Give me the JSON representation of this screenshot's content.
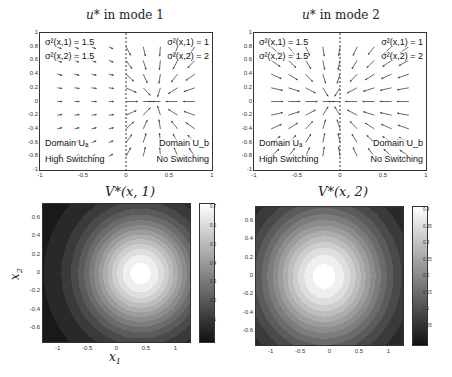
{
  "chart_data": [
    {
      "type": "quiver",
      "title": "u* in mode 1",
      "xlim": [
        -1,
        1
      ],
      "ylim": [
        -1,
        1
      ],
      "xticks": [
        "-1",
        "-0.5",
        "0",
        "0.5",
        "1"
      ],
      "yticks": [
        "1",
        "0.8",
        "0.6",
        "0.4",
        "0.2",
        "0",
        "-0.2",
        "-0.4",
        "-0.6",
        "-0.8",
        "-1"
      ],
      "divider_x": 0,
      "annotations": {
        "left_sigma1": "σ²(x,1) = 1.5",
        "left_sigma2": "σ²(x,2) = 1.5",
        "right_sigma1": "σ²(x,1) = 1",
        "right_sigma2": "σ²(x,2) = 2",
        "left_domain": "Domain Uₐ",
        "left_desc": "High Switching",
        "right_domain": "Domain U_b",
        "right_desc": "No Switching"
      },
      "attractor": [
        0.35,
        0
      ]
    },
    {
      "type": "quiver",
      "title": "u* in mode 2",
      "xlim": [
        -1,
        1
      ],
      "ylim": [
        -1,
        1
      ],
      "xticks": [
        "-1",
        "-0.5",
        "0",
        "0.5",
        "1"
      ],
      "yticks": [
        "1",
        "0.8",
        "0.6",
        "0.4",
        "0.2",
        "0",
        "-0.2",
        "-0.4",
        "-0.6",
        "-0.8",
        "-1"
      ],
      "divider_x": 0,
      "annotations": {
        "left_sigma1": "σ²(x,1) = 1.5",
        "left_sigma2": "σ²(x,2) = 1.5",
        "right_sigma1": "σ²(x,1) = 1",
        "right_sigma2": "σ²(x,2) = 2",
        "left_domain": "Domain Uₐ",
        "left_desc": "High Switching",
        "right_domain": "Domain U_b",
        "right_desc": "No Switching"
      },
      "attractor": [
        -0.1,
        0
      ]
    },
    {
      "type": "heatmap",
      "title": "V*(x,1)",
      "xlabel": "x1",
      "ylabel": "x2",
      "xticks": [
        "-1",
        "-0.5",
        "0",
        "0.5",
        "1"
      ],
      "yticks": [
        "0.6",
        "0.4",
        "0.2",
        "0",
        "-0.2",
        "-0.4",
        "-0.6"
      ],
      "colorbar_ticks": [
        "0.7",
        "0.6",
        "0.5",
        "0.4",
        "0.3",
        "0.2",
        "0.1",
        "0"
      ],
      "peak": [
        0.4,
        0
      ],
      "peak_value": 0.7
    },
    {
      "type": "heatmap",
      "title": "V*(x,2)",
      "xticks": [
        "-1",
        "-0.5",
        "0",
        "0.5",
        "1"
      ],
      "yticks": [
        "0.6",
        "0.4",
        "0.2",
        "0",
        "-0.2",
        "-0.4",
        "-0.6"
      ],
      "colorbar_ticks": [
        "0.4",
        "0.35",
        "0.3",
        "0.25",
        "0.2",
        "0.15",
        "0.1",
        "0.05",
        "0"
      ],
      "peak": [
        -0.1,
        0
      ],
      "peak_value": 0.45
    }
  ],
  "labels": {
    "t1a": "u",
    "t1b": "* in mode 1",
    "t2a": "u",
    "t2b": "* in mode 2",
    "t3a": "V",
    "t3b": "*(x, 1)",
    "t4a": "V",
    "t4b": "*(x, 2)",
    "xlab": "x",
    "xsub": "1",
    "ylab": "x",
    "ysub": "2"
  }
}
